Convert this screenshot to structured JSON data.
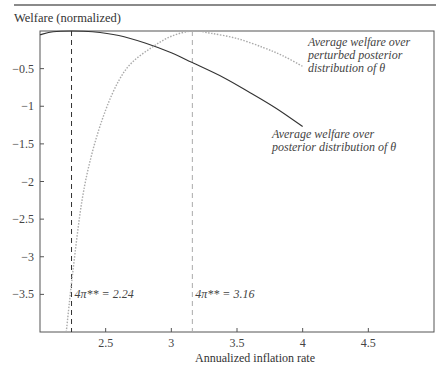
{
  "chart_data": {
    "type": "line",
    "title": "",
    "ylabel": "Welfare (normalized)",
    "xlabel": "Annualized inflation rate",
    "xlim": [
      2.0,
      5.0
    ],
    "ylim": [
      -4.0,
      0.0
    ],
    "x_ticks": [
      2.5,
      3,
      3.5,
      4,
      4.5
    ],
    "x_tick_labels": [
      "2.5",
      "3",
      "3.5",
      "4",
      "4.5"
    ],
    "y_ticks": [
      -0.5,
      -1,
      -1.5,
      -2,
      -2.5,
      -3,
      -3.5
    ],
    "y_tick_labels": [
      "-0.5",
      "-1",
      "-1.5",
      "-2",
      "-2.5",
      "-3",
      "-3.5"
    ],
    "grid": false,
    "series": [
      {
        "name": "Average welfare over posterior distribution of θ",
        "style": "solid",
        "color": "#333333",
        "x": [
          2.0,
          2.1,
          2.24,
          2.4,
          2.6,
          2.8,
          3.0,
          3.16,
          3.4,
          3.6,
          3.8,
          4.0
        ],
        "y": [
          -0.05,
          -0.01,
          0.0,
          -0.01,
          -0.06,
          -0.16,
          -0.29,
          -0.42,
          -0.62,
          -0.82,
          -1.03,
          -1.27
        ]
      },
      {
        "name": "Average welfare over perturbed posterior distribution of θ",
        "style": "dotted",
        "color": "#aaaaaa",
        "x": [
          2.2,
          2.25,
          2.32,
          2.4,
          2.5,
          2.6,
          2.7,
          2.85,
          3.0,
          3.16,
          3.3,
          3.5,
          3.7,
          3.85,
          4.0
        ],
        "y": [
          -4.0,
          -3.2,
          -2.25,
          -1.6,
          -1.05,
          -0.66,
          -0.42,
          -0.22,
          -0.07,
          0.0,
          -0.03,
          -0.1,
          -0.22,
          -0.33,
          -0.47
        ]
      }
    ],
    "vlines": [
      {
        "x": 2.24,
        "label": "4π** = 2.24",
        "color": "#333333"
      },
      {
        "x": 3.16,
        "label": "4π** = 3.16",
        "color": "#aaaaaa"
      }
    ],
    "annotations": [
      {
        "lines": [
          "Average welfare over",
          "perturbed posterior",
          "distribution of θ"
        ],
        "series": 1
      },
      {
        "lines": [
          "Average welfare over",
          "posterior distribution of θ"
        ],
        "series": 0
      }
    ]
  }
}
